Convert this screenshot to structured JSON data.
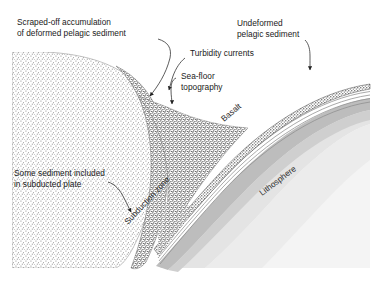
{
  "figure": {
    "background_color": "#ffffff",
    "width": 382,
    "height": 282
  },
  "labels": {
    "scraped_off_line1": "Scraped-off accumulation",
    "scraped_off_line2": "of deformed pelagic sediment",
    "turbidity_currents": "Turbidity currents",
    "sea_floor_line1": "Sea-floor",
    "sea_floor_line2": "topography",
    "undeformed_line1": "Undeformed",
    "undeformed_line2": "pelagic sediment",
    "some_sediment_line1": "Some sediment included",
    "some_sediment_line2": "in subducted plate",
    "basalt": "Basalt",
    "subduction_zone": "Subduction zone",
    "lithosphere": "Lithosphere"
  },
  "colors": {
    "text": "#1a1a1a",
    "leader_line": "#333333",
    "light_stipple": "#8a8a8a",
    "dark_stipple": "#5a5a5a",
    "basalt_band": "#b9b9b9",
    "lithosphere_fill": "#e6e6e6",
    "mantle_fill": "#f1f1f1",
    "sediment_layer": "#9a9a9a",
    "background": "#ffffff"
  }
}
